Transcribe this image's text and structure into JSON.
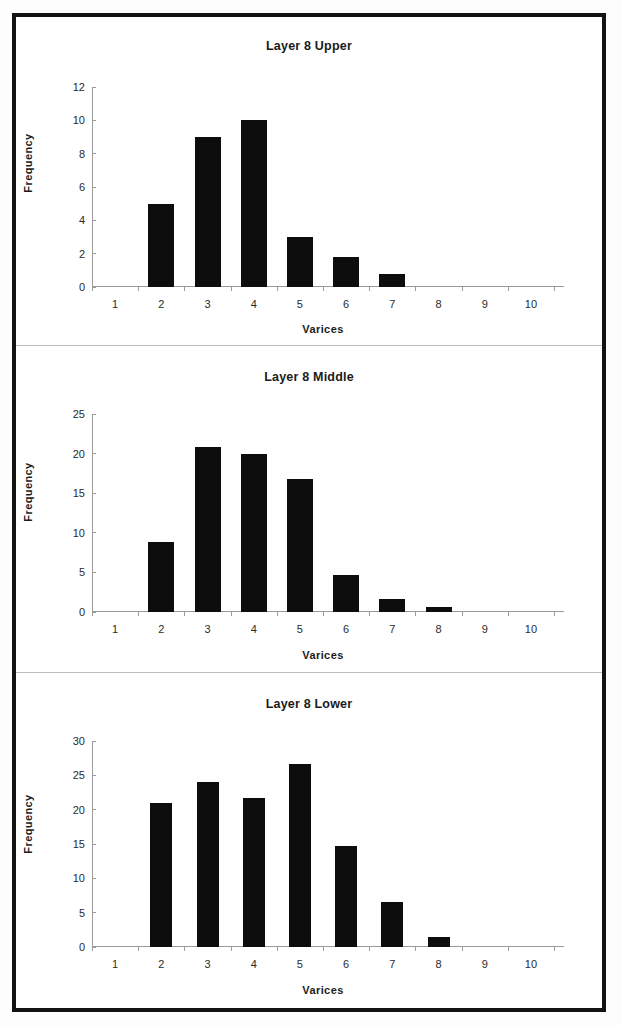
{
  "figure": {
    "background_color": "#ffffff",
    "frame_color": "#131313",
    "bar_color": "#0d0d0d",
    "axis_color": "#9b9b9b"
  },
  "chart_data": [
    {
      "type": "bar",
      "title": "Layer 8 Upper",
      "xlabel": "Varices",
      "ylabel": "Frequency",
      "categories": [
        "1",
        "2",
        "3",
        "4",
        "5",
        "6",
        "7",
        "8",
        "9",
        "10"
      ],
      "values": [
        0,
        5,
        9,
        10,
        3,
        1.8,
        0.8,
        0,
        0,
        0
      ],
      "ylim": [
        0,
        12
      ],
      "yticks": [
        0,
        2,
        4,
        6,
        8,
        10,
        12
      ],
      "grid": false,
      "legend": false
    },
    {
      "type": "bar",
      "title": "Layer 8 Middle",
      "xlabel": "Varices",
      "ylabel": "Frequency",
      "categories": [
        "1",
        "2",
        "3",
        "4",
        "5",
        "6",
        "7",
        "8",
        "9",
        "10"
      ],
      "values": [
        0,
        8.9,
        20.8,
        19.9,
        16.8,
        4.7,
        1.6,
        0.6,
        0,
        0
      ],
      "ylim": [
        0,
        25
      ],
      "yticks": [
        0,
        5,
        10,
        15,
        20,
        25
      ],
      "grid": false,
      "legend": false
    },
    {
      "type": "bar",
      "title": "Layer 8 Lower",
      "xlabel": "Varices",
      "ylabel": "Frequency",
      "categories": [
        "1",
        "2",
        "3",
        "4",
        "5",
        "6",
        "7",
        "8",
        "9",
        "10"
      ],
      "values": [
        0,
        21,
        24,
        21.7,
        26.7,
        14.7,
        6.5,
        1.5,
        0,
        0
      ],
      "ylim": [
        0,
        30
      ],
      "yticks": [
        0,
        5,
        10,
        15,
        20,
        25,
        30
      ],
      "grid": false,
      "legend": false
    }
  ],
  "panels": [
    {
      "bar_width_px": 26
    },
    {
      "bar_width_px": 26
    },
    {
      "bar_width_px": 22
    }
  ]
}
